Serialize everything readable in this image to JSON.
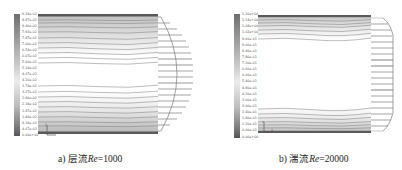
{
  "figure": {
    "panels": [
      {
        "id": "a",
        "caption_prefix": "a) 层流",
        "caption_var": "Re",
        "caption_value": "=1000",
        "flow_type": "laminar",
        "legend": {
          "labels": [
            "9.34e-02",
            "8.87e-02",
            "8.40e-02",
            "7.93e-02",
            "7.47e-02",
            "7.00e-02",
            "6.54e-02",
            "6.07e-02",
            "5.60e-02",
            "5.14e-02",
            "4.67e-02",
            "4.20e-02",
            "3.74e-02",
            "3.27e-02",
            "2.80e-02",
            "2.34e-02",
            "1.87e-02",
            "1.40e-02",
            "9.34e-03",
            "4.67e-03",
            "0.00e+00"
          ]
        },
        "axis_indicator": {
          "y_label": "Y",
          "x_label": "X"
        }
      },
      {
        "id": "b",
        "caption_prefix": "b) 湍流",
        "caption_var": "Re",
        "caption_value": "=20000",
        "flow_type": "turbulent",
        "legend": {
          "labels": [
            "1.20e+00",
            "1.14e+00",
            "1.08e+00",
            "1.02e+00",
            "9.60e-01",
            "9.00e-01",
            "8.40e-01",
            "7.80e-01",
            "7.20e-01",
            "6.60e-01",
            "6.00e-01",
            "5.40e-01",
            "4.80e-01",
            "4.20e-01",
            "3.60e-01",
            "3.00e-01",
            "2.40e-01",
            "1.80e-01",
            "1.20e-01",
            "6.00e-02",
            "0.00e+00"
          ]
        },
        "axis_indicator": {
          "y_label": "Y",
          "x_label": "X"
        }
      }
    ]
  },
  "colors": {
    "wall": "#6a6a6a",
    "streamline": "#7a7a7a",
    "profile_arrow": "#555555",
    "background": "#ffffff"
  }
}
